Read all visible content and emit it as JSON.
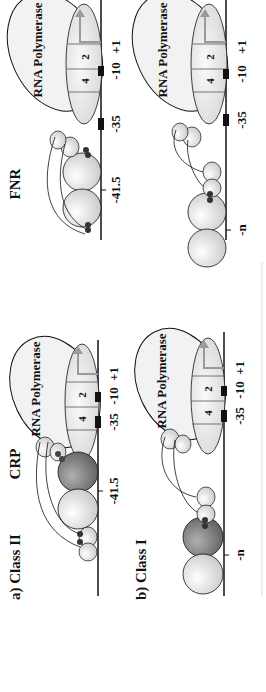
{
  "panels": {
    "crp": {
      "title": "CRP",
      "class_ii_label": "a) Class II",
      "class_i_label": "b) Class I"
    },
    "fnr": {
      "title": "FNR"
    }
  },
  "labels": {
    "rnap": "RNA Polymerase",
    "sigma_domain_4": "4",
    "sigma_domain_2": "2",
    "pos_minus_35": "-35",
    "pos_minus_10": "-10",
    "pos_plus_1": "+1",
    "pos_minus_41_5": "-41.5",
    "pos_minus_n": "-n"
  },
  "colors": {
    "line": "#111111",
    "crp_dark": "#7a7a7a",
    "light_sphere": "#dcdcdc",
    "ellipse_fill": "#ededed",
    "arrow": "#9a9a9a",
    "contact_dot": "#333333"
  }
}
